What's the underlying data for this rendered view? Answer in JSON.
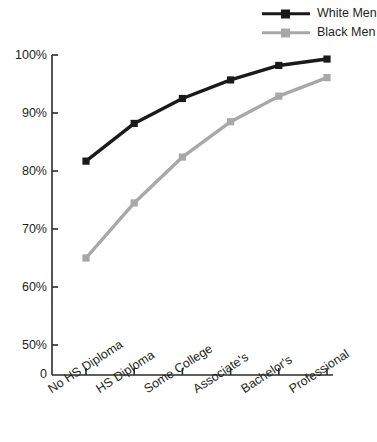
{
  "legend": {
    "position": "top-right",
    "items": [
      {
        "label": "White Men",
        "color": "#1a1a1a",
        "marker": "square"
      },
      {
        "label": "Black Men",
        "color": "#a8a8a8",
        "marker": "square"
      }
    ]
  },
  "axes": {
    "y_ticks": [
      "100%",
      "90%",
      "80%",
      "70%",
      "60%",
      "50%"
    ],
    "y_zero": "0",
    "x_ticks": [
      "No HS Diploma",
      "HS Diploma",
      "Some College",
      "Associate's",
      "Bachelor's",
      "Professional"
    ]
  },
  "chart_data": {
    "type": "line",
    "title": "",
    "subtitle": "",
    "xlabel": "",
    "ylabel": "",
    "categories": [
      "No HS Diploma",
      "HS Diploma",
      "Some College",
      "Associate's",
      "Bachelor's",
      "Professional"
    ],
    "series": [
      {
        "name": "White Men",
        "color": "#1a1a1a",
        "values": [
          81.7,
          88.2,
          92.5,
          95.7,
          98.2,
          99.3
        ]
      },
      {
        "name": "Black Men",
        "color": "#a8a8a8",
        "values": [
          65.0,
          74.5,
          82.4,
          88.5,
          92.9,
          96.1
        ]
      }
    ],
    "ylim": [
      50,
      100
    ],
    "y_tick_values": [
      100,
      90,
      80,
      70,
      60,
      50
    ],
    "y_tick_labels": [
      "100%",
      "90%",
      "80%",
      "70%",
      "60%",
      "50%"
    ],
    "y_axis_break": true,
    "y_axis_break_label": "0",
    "grid": false,
    "legend_position": "top-right",
    "marker": "square",
    "x_tick_rotation": -33
  }
}
